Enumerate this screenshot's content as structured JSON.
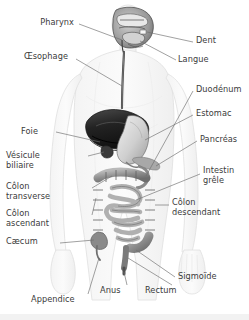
{
  "figure": {
    "language": "fr",
    "background_color": "#ffffff",
    "text_color": "#3b3b3b",
    "leader_line_color": "#6e6e6e",
    "body_outline_color": "#e4e4e4",
    "organ_dark_color": "#2e2e2e",
    "organ_mid_color": "#8a8a8a",
    "organ_light_color": "#c9c9c9",
    "width": 249,
    "height": 320
  },
  "labels": [
    {
      "id": "pharynx",
      "text": "Pharynx",
      "lines": [
        "Pharynx"
      ],
      "side": "left",
      "x": 74,
      "y": 22
    },
    {
      "id": "oesophage",
      "text": "Œsophage",
      "lines": [
        "Œsophage"
      ],
      "side": "left",
      "x": 68,
      "y": 56
    },
    {
      "id": "foie",
      "text": "Foie",
      "lines": [
        "Foie"
      ],
      "side": "left",
      "x": 38,
      "y": 131
    },
    {
      "id": "vesicule-biliaire",
      "text": "Vésicule biliaire",
      "lines": [
        "Vésicule",
        "biliaire"
      ],
      "side": "left",
      "x": 52,
      "y": 155
    },
    {
      "id": "colon-transverse",
      "text": "Côlon transverse",
      "lines": [
        "Côlon",
        "transverse"
      ],
      "side": "left",
      "x": 60,
      "y": 186
    },
    {
      "id": "colon-ascendant",
      "text": "Côlon ascendant",
      "lines": [
        "Côlon",
        "ascendant"
      ],
      "side": "left",
      "x": 58,
      "y": 213
    },
    {
      "id": "caecum",
      "text": "Cæcum",
      "lines": [
        "Cæcum"
      ],
      "side": "left",
      "x": 56,
      "y": 241
    },
    {
      "id": "appendice",
      "text": "Appendice",
      "lines": [
        "Appendice"
      ],
      "side": "left",
      "x": 76,
      "y": 299
    },
    {
      "id": "anus",
      "text": "Anus",
      "lines": [
        "Anus"
      ],
      "side": "left",
      "x": 122,
      "y": 290
    },
    {
      "id": "rectum",
      "text": "Rectum",
      "lines": [
        "Rectum"
      ],
      "side": "left",
      "x": 168,
      "y": 290
    },
    {
      "id": "sigmoide",
      "text": "Sigmoïde",
      "lines": [
        "Sigmoïde"
      ],
      "side": "right",
      "x": 177,
      "y": 276
    },
    {
      "id": "dent",
      "text": "Dent",
      "lines": [
        "Dent"
      ],
      "side": "right",
      "x": 196,
      "y": 40
    },
    {
      "id": "langue",
      "text": "Langue",
      "lines": [
        "Langue"
      ],
      "side": "right",
      "x": 178,
      "y": 59
    },
    {
      "id": "duodenum",
      "text": "Duodénum",
      "lines": [
        "Duodénum"
      ],
      "side": "right",
      "x": 196,
      "y": 89
    },
    {
      "id": "estomac",
      "text": "Estomac",
      "lines": [
        "Estomac"
      ],
      "side": "right",
      "x": 196,
      "y": 113
    },
    {
      "id": "pancreas",
      "text": "Pancréas",
      "lines": [
        "Pancréas"
      ],
      "side": "right",
      "x": 200,
      "y": 139
    },
    {
      "id": "intestin-grele",
      "text": "Intestin grêle",
      "lines": [
        "Intestin",
        "grêle"
      ],
      "side": "right",
      "x": 203,
      "y": 170
    },
    {
      "id": "colon-descendant",
      "text": "Côlon descendant",
      "lines": [
        "Côlon",
        "descendant"
      ],
      "side": "right",
      "x": 172,
      "y": 202
    }
  ],
  "organs": [
    {
      "id": "head",
      "name": "tête-coupe-sagittale"
    },
    {
      "id": "esophagus",
      "name": "oesophage"
    },
    {
      "id": "liver",
      "name": "foie"
    },
    {
      "id": "gallbladder",
      "name": "vesicule-biliaire"
    },
    {
      "id": "stomach",
      "name": "estomac"
    },
    {
      "id": "pancreas",
      "name": "pancreas"
    },
    {
      "id": "colon",
      "name": "gros-intestin"
    },
    {
      "id": "small-bowel",
      "name": "intestin-grele"
    },
    {
      "id": "rectum",
      "name": "rectum"
    }
  ]
}
